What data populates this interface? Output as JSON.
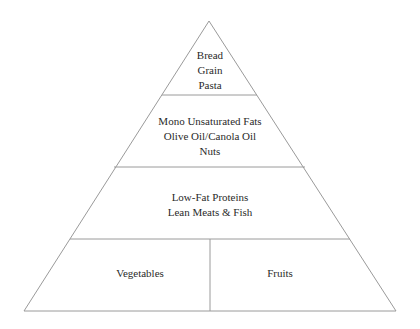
{
  "diagram": {
    "type": "food-pyramid",
    "line_color": "#9a9a9a",
    "text_color": "#2a2a2a",
    "tiers": [
      {
        "id": "top",
        "lines": [
          "Bread",
          "Grain",
          "Pasta"
        ]
      },
      {
        "id": "upper-middle",
        "lines": [
          "Mono Unsaturated Fats",
          "Olive Oil/Canola Oil",
          "Nuts"
        ]
      },
      {
        "id": "lower-middle",
        "lines": [
          "Low-Fat Proteins",
          "Lean Meats & Fish"
        ]
      },
      {
        "id": "base",
        "sections": [
          {
            "id": "left",
            "lines": [
              "Vegetables"
            ]
          },
          {
            "id": "right",
            "lines": [
              "Fruits"
            ]
          }
        ]
      }
    ]
  }
}
